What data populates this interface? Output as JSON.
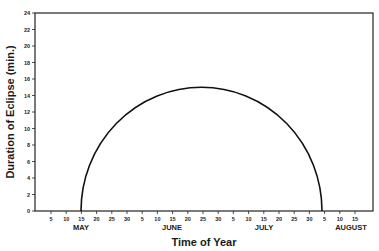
{
  "chart_data": {
    "type": "line",
    "title": "",
    "xlabel": "Time of Year",
    "ylabel": "Duration of Eclipse (min.)",
    "ylim": [
      0,
      24
    ],
    "yticks": [
      0,
      2,
      4,
      6,
      8,
      10,
      12,
      14,
      16,
      18,
      20,
      22,
      24
    ],
    "grid": false,
    "legend": null,
    "x_tick_labels": [
      "5",
      "10",
      "15",
      "20",
      "25",
      "30",
      "5",
      "10",
      "15",
      "20",
      "25",
      "30",
      "5",
      "10",
      "15",
      "20",
      "25",
      "30",
      "5",
      "10",
      "15"
    ],
    "months": [
      "MAY",
      "JUNE",
      "JULY",
      "AUGUST"
    ],
    "series": [
      {
        "name": "Duration of Eclipse",
        "x": [
          "May 15",
          "May 20",
          "May 25",
          "May 30",
          "Jun 5",
          "Jun 10",
          "Jun 15",
          "Jun 20",
          "Jun 22",
          "Jun 25",
          "Jun 30",
          "Jul 5",
          "Jul 10",
          "Jul 15",
          "Jul 20",
          "Jul 25",
          "Jul 30"
        ],
        "values": [
          0,
          8.2,
          10.9,
          12.6,
          13.8,
          14.5,
          14.9,
          15.0,
          15.0,
          15.0,
          14.7,
          14.1,
          13.1,
          11.6,
          9.5,
          6.3,
          0
        ]
      }
    ]
  }
}
